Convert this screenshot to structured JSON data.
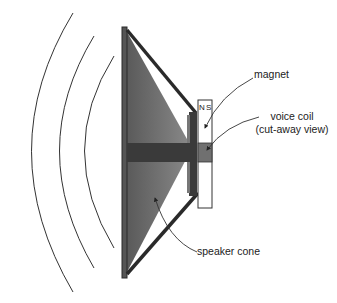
{
  "diagram": {
    "labels": {
      "magnet": "magnet",
      "voice_coil_line1": "voice coil",
      "voice_coil_line2": "(cut-away view)",
      "speaker_cone": "speaker cone",
      "pole_n": "N",
      "pole_s": "S"
    },
    "colors": {
      "frame": "#2a2a2a",
      "cone_fill": "#6e6e6e",
      "coil_bar": "#3a3a3a",
      "coil_section": "#707070",
      "sound_waves": "#333333",
      "magnet_fill": "#ffffff"
    },
    "sound_waves_count": 3
  }
}
